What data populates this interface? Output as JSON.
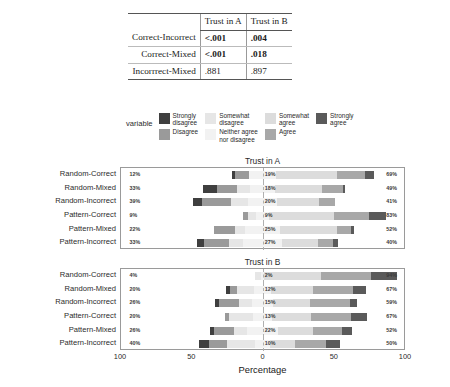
{
  "table": {
    "corner_label": "",
    "columns": [
      "Trust in A",
      "Trust in B"
    ],
    "rows": [
      {
        "label": "Correct-Incorrect",
        "trust_a": "<.001",
        "trust_b": ".004",
        "bold_a": true,
        "bold_b": true
      },
      {
        "label": "Correct-Mixed",
        "trust_a": "<.001",
        "trust_b": ".018",
        "bold_a": true,
        "bold_b": true
      },
      {
        "label": "Incorrrect-Mixed",
        "trust_a": ".881",
        "trust_b": ".897",
        "bold_a": false,
        "bold_b": false
      }
    ]
  },
  "legend": {
    "title": "variable",
    "columns": [
      [
        {
          "label": "Strongly\ndisagree",
          "color": "#3f3f3f"
        },
        {
          "label": "Disagree",
          "color": "#9a9a9a"
        }
      ],
      [
        {
          "label": "Somewhat\ndisagree",
          "color": "#e6e6e6"
        },
        {
          "label": "Neither agree\nnor disagree",
          "color": "#f2f2f2"
        }
      ],
      [
        {
          "label": "Somewhat\nagree",
          "color": "#dcdcdc"
        },
        {
          "label": "Agree",
          "color": "#a8a8a8"
        }
      ],
      [
        {
          "label": "Strongly\nagree",
          "color": "#5a5a5a"
        }
      ]
    ]
  },
  "axis": {
    "title": "Percentage",
    "ticks": [
      "100",
      "50",
      "0",
      "50",
      "100"
    ],
    "tick_positions": [
      0,
      25,
      50,
      75,
      100
    ]
  },
  "chart_data": {
    "type": "bar",
    "subtype": "diverging-stacked-likert",
    "title": "",
    "xlabel": "Percentage",
    "ylabel": "",
    "xlim": [
      -100,
      100
    ],
    "grid": false,
    "legend_position": "top",
    "categories": [
      "Strongly disagree",
      "Disagree",
      "Somewhat disagree",
      "Neither agree nor disagree",
      "Somewhat agree",
      "Agree",
      "Strongly agree"
    ],
    "category_colors": [
      "#3f3f3f",
      "#9a9a9a",
      "#e6e6e6",
      "#f2f2f2",
      "#dcdcdc",
      "#a8a8a8",
      "#5a5a5a"
    ],
    "panels": [
      {
        "name": "Trust in A",
        "rows": [
          {
            "label": "Random-Correct",
            "pct_negative": "12%",
            "pct_neutral": "19%",
            "pct_positive": "69%",
            "values": [
              2,
              10,
              0,
              19,
              43,
              20,
              6
            ]
          },
          {
            "label": "Random-Mixed",
            "pct_negative": "33%",
            "pct_neutral": "18%",
            "pct_positive": "49%",
            "values": [
              10,
              14,
              9,
              18,
              33,
              15,
              1
            ]
          },
          {
            "label": "Random-Incorrect",
            "pct_negative": "39%",
            "pct_neutral": "20%",
            "pct_positive": "41%",
            "values": [
              6,
              21,
              12,
              20,
              30,
              11,
              0
            ]
          },
          {
            "label": "Pattern-Correct",
            "pct_negative": "9%",
            "pct_neutral": "9%",
            "pct_positive": "83%",
            "values": [
              0,
              3,
              6,
              9,
              46,
              25,
              12
            ]
          },
          {
            "label": "Pattern-Mixed",
            "pct_negative": "22%",
            "pct_neutral": "25%",
            "pct_positive": "52%",
            "values": [
              0,
              15,
              7,
              25,
              40,
              10,
              2
            ]
          },
          {
            "label": "Pattern-Incorrect",
            "pct_negative": "33%",
            "pct_neutral": "27%",
            "pct_positive": "40%",
            "values": [
              5,
              18,
              10,
              27,
              26,
              10,
              4
            ]
          }
        ]
      },
      {
        "name": "Trust in B",
        "rows": [
          {
            "label": "Random-Correct",
            "pct_negative": "4%",
            "pct_neutral": "2%",
            "pct_positive": "94%",
            "values": [
              0,
              0,
              4,
              2,
              40,
              36,
              18
            ]
          },
          {
            "label": "Random-Mixed",
            "pct_negative": "20%",
            "pct_neutral": "12%",
            "pct_positive": "67%",
            "values": [
              3,
              5,
              12,
              12,
              30,
              28,
              9
            ]
          },
          {
            "label": "Random-Incorrect",
            "pct_negative": "26%",
            "pct_neutral": "15%",
            "pct_positive": "59%",
            "values": [
              3,
              14,
              9,
              15,
              26,
              28,
              5
            ]
          },
          {
            "label": "Pattern-Correct",
            "pct_negative": "20%",
            "pct_neutral": "13%",
            "pct_positive": "67%",
            "values": [
              0,
              3,
              17,
              13,
              28,
              28,
              11
            ]
          },
          {
            "label": "Pattern-Mixed",
            "pct_negative": "26%",
            "pct_neutral": "22%",
            "pct_positive": "52%",
            "values": [
              3,
              14,
              9,
              22,
              25,
              20,
              7
            ]
          },
          {
            "label": "Pattern-Incorrect",
            "pct_negative": "40%",
            "pct_neutral": "10%",
            "pct_positive": "50%",
            "values": [
              7,
              13,
              20,
              10,
              18,
              22,
              10
            ]
          }
        ]
      }
    ]
  }
}
